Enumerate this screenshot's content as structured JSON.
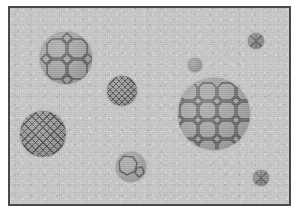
{
  "figure": {
    "canvas": {
      "width": 299,
      "height": 214
    },
    "outer_margin_color": "#ffffff",
    "frame": {
      "name": "plate-frame",
      "x": 8,
      "y": 6,
      "width": 283,
      "height": 200,
      "border_color": "#4a4a4a",
      "border_width": 2
    },
    "matrix": {
      "name": "matrix-field",
      "fill_color": "#c9c9c9",
      "texture": "fine random speckle / noise"
    },
    "grain_palette": {
      "grain_fill": "#a3a3a3",
      "cell_fill": "#a6a6a6",
      "hatch_fill": "#9a9a9a",
      "plain_fill": "#9d9d9d",
      "cell_outline": "#5d5d5d",
      "grain_shadow": "rgba(90,90,90,0.55)"
    },
    "grains": [
      {
        "id": "grain-upper-left",
        "label": "Large octagon-square tessellated grain (upper left)",
        "pattern": "octagon-square-tessellation",
        "cx": 66,
        "cy": 58,
        "radius": 26,
        "cell_scale": "coarse",
        "fill": "#a6a6a6"
      },
      {
        "id": "grain-right-large",
        "label": "Largest octagon-square tessellated grain (right of center)",
        "pattern": "octagon-square-tessellation",
        "cx": 214,
        "cy": 114,
        "radius": 36,
        "cell_scale": "medium",
        "fill": "#a6a6a6"
      },
      {
        "id": "grain-lower-left",
        "label": "Cross-hatched grain (lower left)",
        "pattern": "diagonal-cross-hatch",
        "cx": 43,
        "cy": 134,
        "radius": 23,
        "cell_scale": "fine",
        "fill": "#9a9a9a"
      },
      {
        "id": "grain-center-hatched",
        "label": "Small cross-hatched grain (center)",
        "pattern": "diagonal-cross-hatch",
        "cx": 122,
        "cy": 91,
        "radius": 15,
        "cell_scale": "fine",
        "fill": "#9a9a9a"
      },
      {
        "id": "grain-bottom-center",
        "label": "Few-celled grain (bottom center)",
        "pattern": "few-large-cells",
        "cx": 131,
        "cy": 167,
        "radius": 15,
        "cell_scale": "coarse",
        "fill": "#a6a6a6"
      },
      {
        "id": "grain-top-right-x",
        "label": "Tiny X-marked grain (top right)",
        "pattern": "x-cross",
        "cx": 256,
        "cy": 41,
        "radius": 8,
        "cell_scale": "single",
        "fill": "#8f8f8f"
      },
      {
        "id": "grain-bottom-right-x",
        "label": "Tiny X-marked grain (bottom right)",
        "pattern": "x-cross",
        "cx": 261,
        "cy": 178,
        "radius": 8,
        "cell_scale": "single",
        "fill": "#8f8f8f"
      },
      {
        "id": "grain-plain-small",
        "label": "Plain unpatterned small grain (upper right of center)",
        "pattern": "plain",
        "cx": 195,
        "cy": 65,
        "radius": 7,
        "cell_scale": "none",
        "fill": "#9d9d9d"
      }
    ],
    "legend_note": "No axis labels, tick marks, legend, or annotation text are present in the image."
  }
}
